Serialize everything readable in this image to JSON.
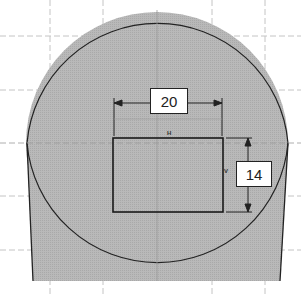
{
  "sketch": {
    "dimensions": [
      {
        "id": "width",
        "value": "20",
        "orientation": "horizontal"
      },
      {
        "id": "height",
        "value": "14",
        "orientation": "vertical"
      }
    ],
    "constraints": {
      "horizontal_label": "H",
      "vertical_label": "V"
    },
    "colors": {
      "body_fill": "#b4b4b4",
      "outline": "#222222",
      "grid": "#bdbdbd",
      "background": "#ffffff"
    }
  }
}
